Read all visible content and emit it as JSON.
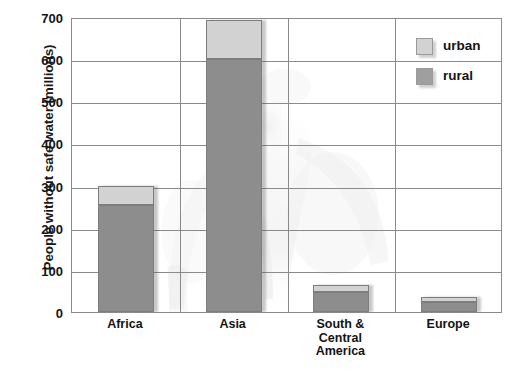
{
  "chart_data": {
    "type": "bar",
    "subtype": "stacked-bar",
    "title": "",
    "xlabel": "",
    "ylabel": "People without safe water (millions)",
    "ylim": [
      0,
      700
    ],
    "ytick_step": 100,
    "yticks": [
      "700",
      "600",
      "500",
      "400",
      "300",
      "200",
      "100",
      "0"
    ],
    "ytick_values": [
      700,
      600,
      500,
      400,
      300,
      200,
      100,
      0
    ],
    "grid": true,
    "grid_axis": "both",
    "legend_position": "top-right",
    "categories": [
      "Africa",
      "Asia",
      "South &\nCentral\nAmerica",
      "Europe"
    ],
    "category_labels_flat": [
      "Africa",
      "Asia",
      "South & Central America",
      "Europe"
    ],
    "series": [
      {
        "name": "rural",
        "color": "#8d8d8d",
        "values": [
          255,
          600,
          48,
          23
        ]
      },
      {
        "name": "urban",
        "color": "#d2d2d2",
        "values": [
          45,
          93,
          17,
          12
        ]
      }
    ],
    "totals": [
      300,
      693,
      65,
      35
    ]
  },
  "legend": {
    "items": [
      {
        "label": "urban",
        "swatch": "urban-swatch"
      },
      {
        "label": "rural",
        "swatch": "rural-swatch"
      }
    ]
  },
  "axes": {
    "y_title": "People without safe water (millions)"
  }
}
